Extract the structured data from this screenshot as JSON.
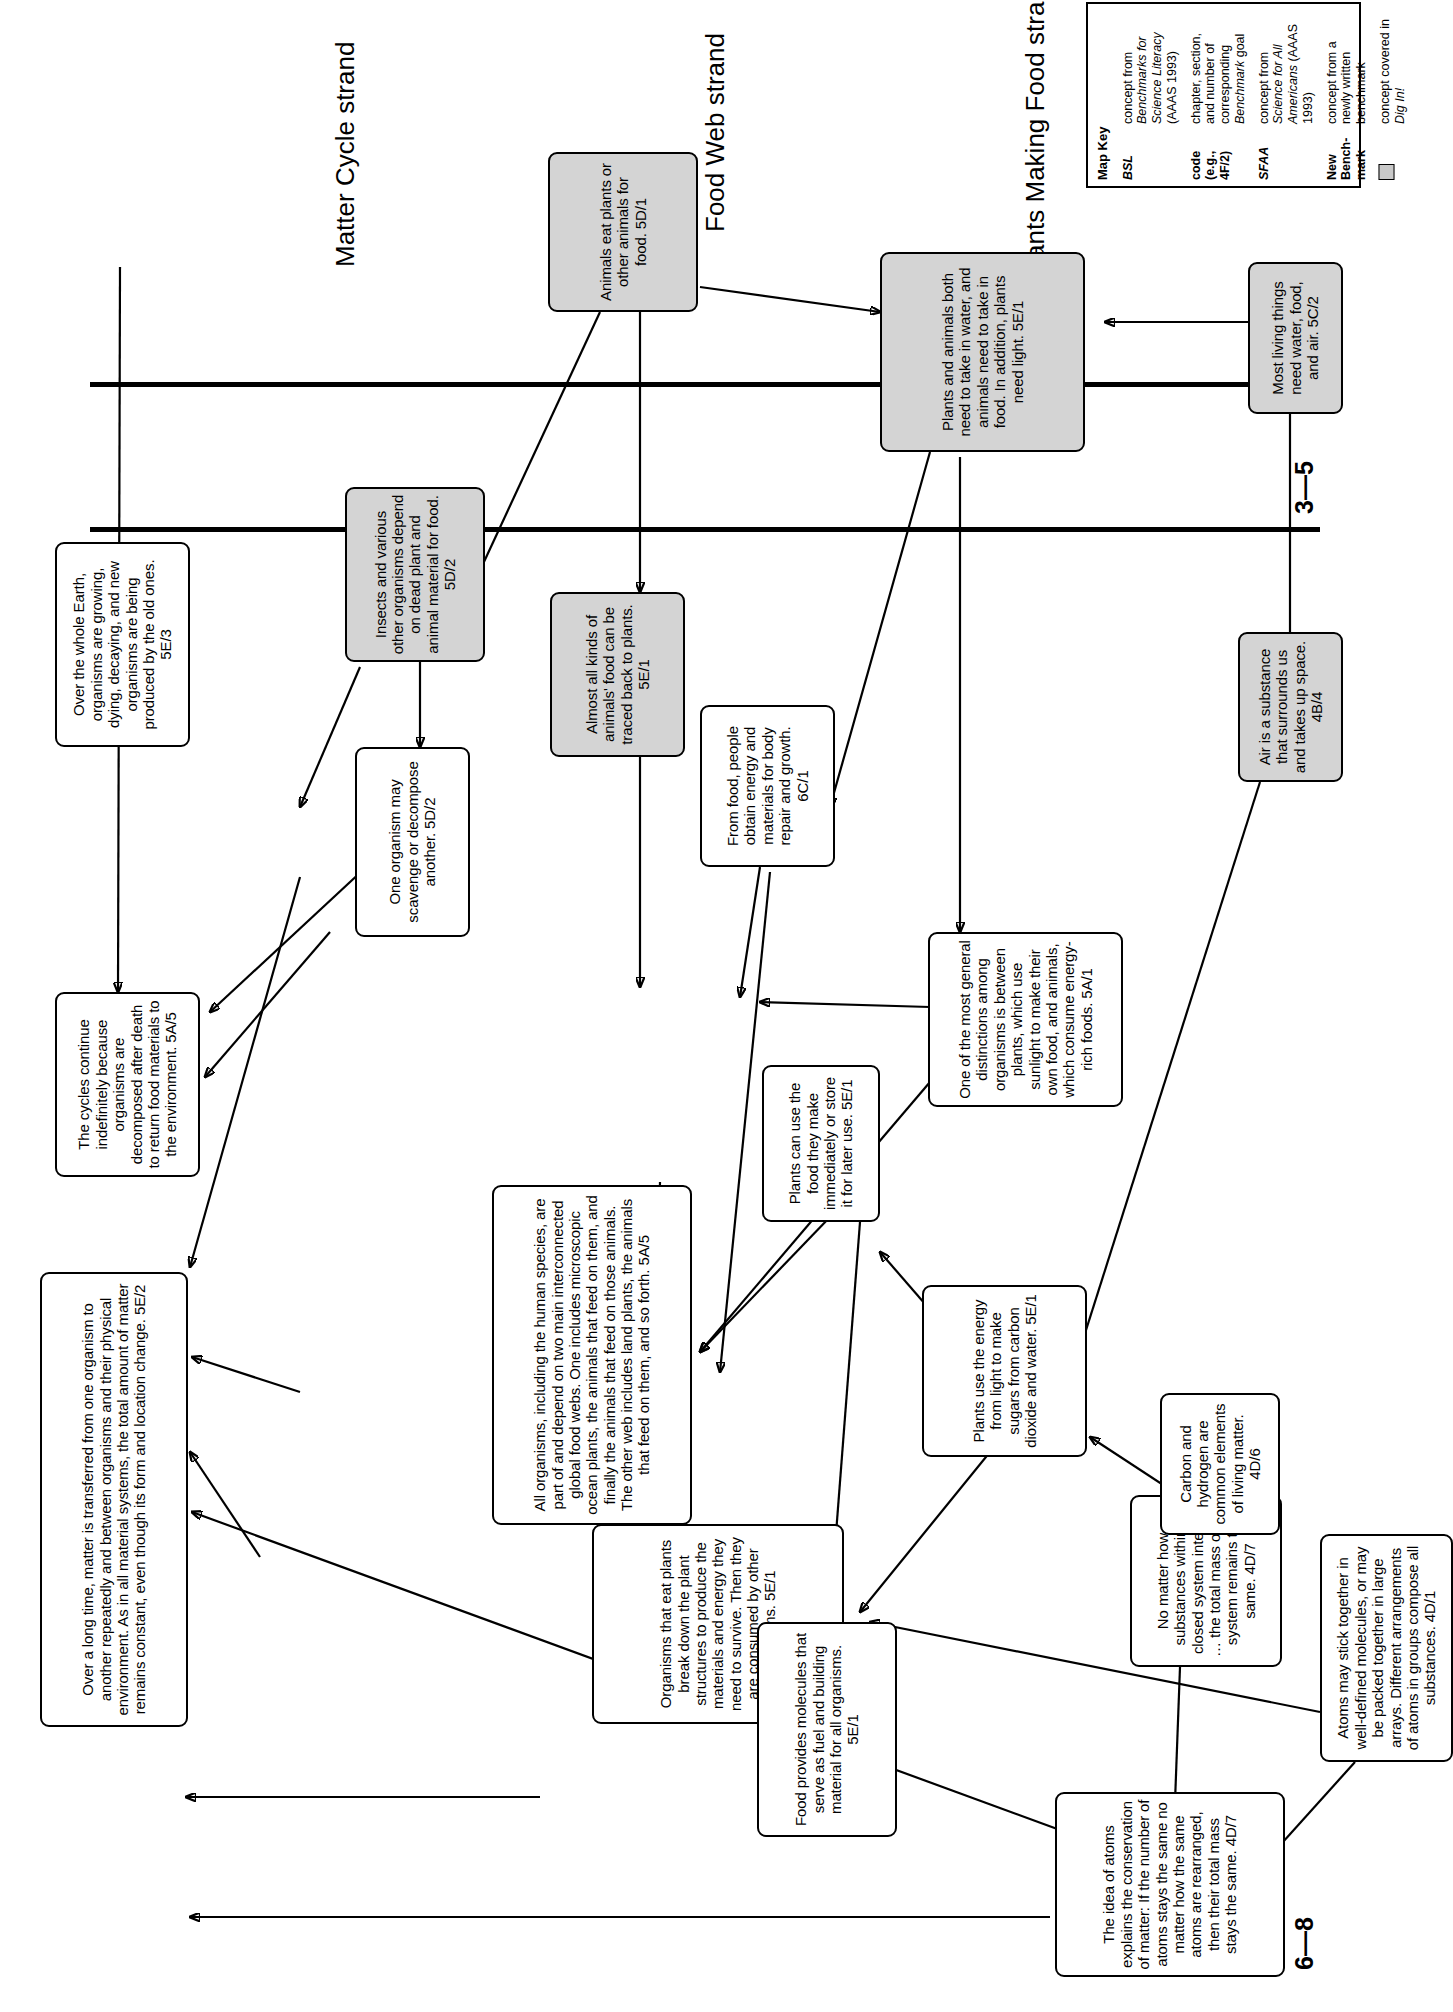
{
  "diagram": {
    "orientation": "rotated-90-ccw"
  },
  "bands": [
    {
      "id": "band-6-8",
      "label": "6—8"
    },
    {
      "id": "band-3-5",
      "label": "3—5"
    },
    {
      "id": "band-k-2",
      "label": "K—2"
    }
  ],
  "strands": [
    {
      "id": "strand-matter-cycle",
      "label": "Matter Cycle strand"
    },
    {
      "id": "strand-food-web",
      "label": "Food Web strand"
    },
    {
      "id": "strand-plants-making-food",
      "label": "Plants Making Food strand"
    }
  ],
  "nodes": [
    {
      "id": "n-matter-transferred",
      "shaded": false,
      "text": "Over a long time, matter is transferred from one organism to another repeatedly and between organisms and their physical environment. As in all material systems, the total amount of matter remains constant, even though its form and location change. 5E/2"
    },
    {
      "id": "n-cycles-continue",
      "shaded": false,
      "text": "The cycles continue indefinitely because organisms are decomposed after death to return food materials to the environment. 5A/5"
    },
    {
      "id": "n-over-whole-earth",
      "shaded": false,
      "text": "Over the whole Earth, organisms are growing, dying, decaying, and new organisms are being produced by the old ones. 5E/3"
    },
    {
      "id": "n-one-organism-scavenge",
      "shaded": false,
      "text": "One organism may scavenge or decompose another. 5D/2"
    },
    {
      "id": "n-insects-various",
      "shaded": true,
      "text": "Insects and various other organisms depend on dead plant and animal material for food. 5D/2"
    },
    {
      "id": "n-all-organisms-food-webs",
      "shaded": false,
      "text": "All organisms, including the human species, are part of and depend on two main interconnected global food webs. One includes microscopic ocean plants, the animals that feed on them, and finally the animals that feed on those animals. The other web includes land plants, the animals that feed on them, and so forth. 5A/5"
    },
    {
      "id": "n-almost-all-kinds",
      "shaded": true,
      "text": "Almost all kinds of animals' food can be traced back to plants. 5E/1"
    },
    {
      "id": "n-animals-eat-plants",
      "shaded": true,
      "text": "Animals eat plants or other animals for food. 5D/1"
    },
    {
      "id": "n-organisms-break-down",
      "shaded": false,
      "text": "Organisms that eat plants break down the plant structures to produce the materials and energy they need to survive. Then they are consumed by other organisms. 5E/1"
    },
    {
      "id": "n-from-food-people",
      "shaded": false,
      "text": "From food, people obtain energy and materials for body repair and growth. 6C/1"
    },
    {
      "id": "n-food-provides-molecules",
      "shaded": false,
      "text": "Food provides molecules that serve as fuel and building material for all organisms. 5E/1"
    },
    {
      "id": "n-plants-can-use-food",
      "shaded": false,
      "text": "Plants can use the food they make immediately or store it for later use. 5E/1"
    },
    {
      "id": "n-one-of-most-general",
      "shaded": false,
      "text": "One of the most general distinctions among organisms is between plants, which use sunlight to make their own food, and animals, which consume energy-rich foods. 5A/1"
    },
    {
      "id": "n-plants-use-energy",
      "shaded": false,
      "text": "Plants use the energy from light to make sugars from carbon dioxide and water. 5E/1"
    },
    {
      "id": "n-plants-animals-both-need",
      "shaded": true,
      "text": "Plants and animals both need to take in water, and animals need to take in food. In addition, plants need light. 5E/1"
    },
    {
      "id": "n-idea-of-atoms",
      "shaded": false,
      "text": "The idea of atoms explains the conservation of matter: If the number of atoms stays the same no matter how the same atoms are rearranged, then their total mass stays the same. 4D/7"
    },
    {
      "id": "n-no-matter-how",
      "shaded": false,
      "text": "No matter how substances within a closed system interact … the total mass of the system remains the same. 4D/7"
    },
    {
      "id": "n-carbon-hydrogen",
      "shaded": false,
      "text": "Carbon and hydrogen are common elements of living matter. 4D/6"
    },
    {
      "id": "n-atoms-may-stick",
      "shaded": false,
      "text": "Atoms may stick together in well-defined molecules, or may be packed together in large arrays. Different arrangements of atoms in groups compose all substances. 4D/1"
    },
    {
      "id": "n-air-is-substance",
      "shaded": true,
      "text": "Air is a substance that surrounds us and takes up space. 4B/4"
    },
    {
      "id": "n-most-living-things",
      "shaded": true,
      "text": "Most living things need water, food, and air. 5C/2"
    }
  ],
  "map_key": {
    "title": "Map Key",
    "rows": [
      {
        "term": "BSL",
        "term_italic": true,
        "desc": "concept from Benchmarks for Science Literacy (AAAS 1993)",
        "desc_plain": "concept from ",
        "desc_italic": "Benchmarks for Science Literacy",
        "desc_tail": " (AAAS 1993)"
      },
      {
        "term": "code (e.g., 4F/2)",
        "term_italic": false,
        "desc": "chapter, section, and number of corresponding Benchmark goal",
        "desc_plain": "chapter, section, and number of corresponding ",
        "desc_italic": "Benchmark",
        "desc_tail": " goal"
      },
      {
        "term": "SFAA",
        "term_italic": true,
        "desc": "concept from Science for All Americans (AAAS 1993)",
        "desc_plain": "concept from ",
        "desc_italic": "Science for All Americans",
        "desc_tail": " (AAAS 1993)"
      },
      {
        "term": "New Bench-mark",
        "term_italic": false,
        "desc": "concept from a newly written benchmark",
        "desc_plain": "concept from a newly written benchmark",
        "desc_italic": "",
        "desc_tail": ""
      },
      {
        "term": "",
        "term_italic": false,
        "desc": "concept covered in Dig In!",
        "desc_plain": "concept covered in ",
        "desc_italic": "Dig In!",
        "desc_tail": ""
      }
    ]
  },
  "colors": {
    "shaded_fill": "#d4d4d4",
    "line": "#000000",
    "background": "#ffffff"
  }
}
